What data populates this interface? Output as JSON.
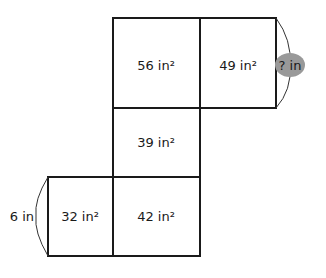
{
  "diagram": {
    "type": "net-area-diagram",
    "regions": [
      {
        "id": "top-left",
        "label": "56 in²"
      },
      {
        "id": "top-right",
        "label": "49 in²"
      },
      {
        "id": "middle",
        "label": "39 in²"
      },
      {
        "id": "bottom-left",
        "label": "32 in²"
      },
      {
        "id": "bottom-right",
        "label": "42 in²"
      }
    ],
    "dimensions": {
      "unknown": "? in",
      "known": "6 in"
    },
    "colors": {
      "line": "#1a1a1a",
      "unknown_bubble": "#999999"
    }
  }
}
